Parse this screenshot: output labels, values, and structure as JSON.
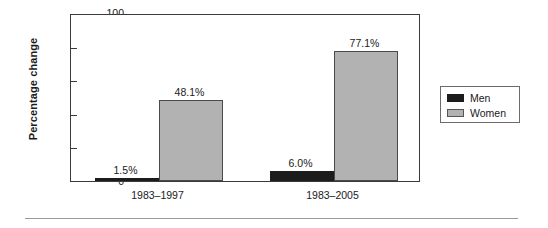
{
  "chart_data": {
    "type": "bar",
    "title": "",
    "xlabel": "",
    "ylabel": "Percentage change",
    "ylim": [
      0,
      100
    ],
    "yticks": [
      0,
      20,
      40,
      60,
      80,
      100
    ],
    "ytick_labels": [
      "0",
      "20",
      "40",
      "60",
      "80",
      "100"
    ],
    "grid": false,
    "legend_position": "right",
    "categories": [
      "1983–1997",
      "1983–2005"
    ],
    "series": [
      {
        "name": "Men",
        "color": "#1c1c1c",
        "values": [
          1.5,
          6.0
        ],
        "data_labels": [
          "1.5%",
          "6.0%"
        ]
      },
      {
        "name": "Women",
        "color": "#b2b2b2",
        "values": [
          48.1,
          77.1
        ],
        "data_labels": [
          "48.1%",
          "77.1%"
        ]
      }
    ]
  },
  "legend": {
    "entries": [
      {
        "label": "Men"
      },
      {
        "label": "Women"
      }
    ]
  }
}
